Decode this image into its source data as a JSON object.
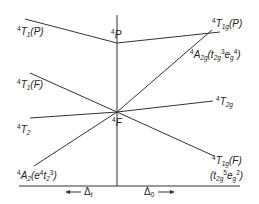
{
  "diagram": {
    "title": "",
    "type": "Orgel diagram (d3/d7 high-spin, tetrahedral vs octahedral)",
    "colors": {
      "line": "#333333",
      "text": "#222222",
      "background": "#ffffff"
    },
    "left_labels": {
      "t1p": {
        "pre": "4",
        "main": "T",
        "sub": "1",
        "rest": "(P)"
      },
      "t1f": {
        "pre": "4",
        "main": "T",
        "sub": "1",
        "rest": "(F)"
      },
      "t2": {
        "pre": "4",
        "main": "T",
        "sub": "2"
      },
      "a2": {
        "pre": "4",
        "main": "A",
        "sub": "2",
        "rest_open": "(e",
        "sup1": "4",
        "mid": "t",
        "sub2": "2",
        "sup2": "3",
        "rest_close": ")"
      }
    },
    "center_labels": {
      "p": {
        "pre": "4",
        "main": "P"
      },
      "f": {
        "pre": "4",
        "main": "F"
      }
    },
    "right_labels": {
      "t1gp": {
        "pre": "4",
        "main": "T",
        "sub": "1g",
        "rest": "(P)"
      },
      "a2g": {
        "pre": "4",
        "main": "A",
        "sub": "2g",
        "open": "(t",
        "sub2": "2g",
        "sup1": "3",
        "mid": "e",
        "sub3": "g",
        "sup2": "4",
        "close": ")"
      },
      "t2g": {
        "pre": "4",
        "main": "T",
        "sub": "2g"
      },
      "t1gf": {
        "pre": "4",
        "main": "T",
        "sub": "1g",
        "rest": "(F)"
      },
      "t1gf_config": {
        "open": "(t",
        "sub": "2g",
        "sup": "5",
        "mid": "e",
        "sub2": "g",
        "sup2": "2",
        "close": ")"
      }
    },
    "axis": {
      "left_label": "← Δt",
      "left_arrow": "←",
      "left_text": "Δ",
      "left_sub": "t",
      "right_text": "Δ",
      "right_sub": "0",
      "right_arrow": "→"
    }
  }
}
